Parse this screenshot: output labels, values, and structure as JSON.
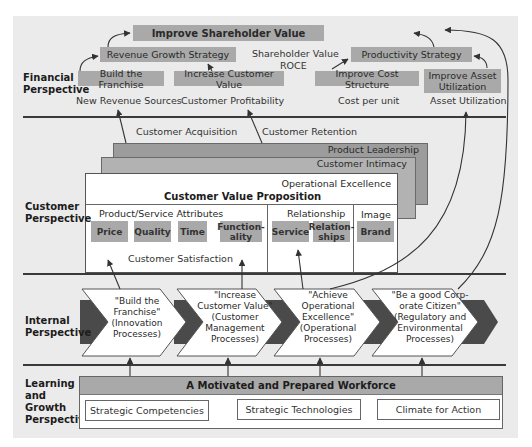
{
  "colors": {
    "background": "#ebebeb",
    "box_gray": "#a9a9a9",
    "layer_dark": "#9a9a9a",
    "layer_mid": "#b0b0b0",
    "chevron_dark": "#4a4a4a",
    "line": "#3a3a3a"
  },
  "perspectives": {
    "financial": "Financial Perspective",
    "customer": "Customer Perspective",
    "internal": "Internal Perspective",
    "learning": [
      "Learning",
      "and",
      "Growth",
      "Perspective"
    ]
  },
  "financial": {
    "top": "Improve Shareholder Value",
    "revenue_strategy": "Revenue Growth Strategy",
    "productivity_strategy": "Productivity Strategy",
    "shareholder_value": "Shareholder Value",
    "roce": "ROCE",
    "build_franchise": "Build the Franchise",
    "increase_customer_value": "Increase Customer Value",
    "improve_cost_structure": "Improve Cost Structure",
    "improve_asset_utilization": [
      "Improve Asset",
      "Utilization"
    ],
    "measures": [
      "New Revenue Sources",
      "Customer Profitability",
      "Cost per unit",
      "Asset Utilization"
    ]
  },
  "customer": {
    "acquisition": "Customer Acquisition",
    "retention": "Customer Retention",
    "layers": [
      "Product Leadership",
      "Customer Intimacy",
      "Operational Excellence"
    ],
    "cvp_title": "Customer Value Proposition",
    "groups": {
      "product_service": "Product/Service Attributes",
      "relationship": "Relationship",
      "image": "Image"
    },
    "attributes": {
      "price": "Price",
      "quality": "Quality",
      "time": "Time",
      "functionality": [
        "Function-",
        "ality"
      ],
      "service": "Service",
      "relationships": [
        "Relation-",
        "ships"
      ],
      "brand": "Brand"
    },
    "satisfaction": "Customer Satisfaction"
  },
  "internal": {
    "processes": [
      {
        "lines": [
          "\"Build the",
          "Franchise\"",
          "(Innovation",
          "Processes)"
        ]
      },
      {
        "lines": [
          "\"Increase",
          "Customer Value\"",
          "(Customer",
          "Management",
          "Processes)"
        ]
      },
      {
        "lines": [
          "\"Achieve",
          "Operational",
          "Excellence\"",
          "(Operational",
          "Processes)"
        ]
      },
      {
        "lines": [
          "\"Be a good Corp-",
          "orate Citizen\"",
          "(Regulatory and",
          "Environmental",
          "Processes)"
        ]
      }
    ]
  },
  "learning": {
    "header": "A Motivated and Prepared Workforce",
    "items": [
      "Strategic Competencies",
      "Strategic Technologies",
      "Climate for Action"
    ]
  }
}
